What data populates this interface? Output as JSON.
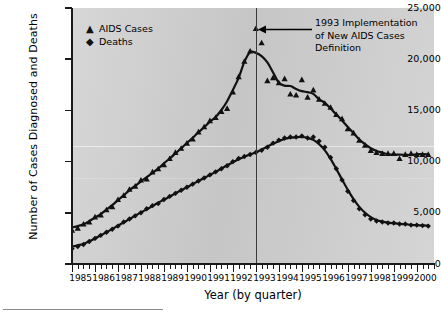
{
  "chart_data": {
    "type": "line",
    "title": "",
    "xlabel": "Year (by quarter)",
    "ylabel": "Number of Cases Diagnosed and Deaths",
    "xlim": [
      1985,
      2000.75
    ],
    "ylim": [
      0,
      25000
    ],
    "ytick_values": [
      0,
      5000,
      10000,
      15000,
      20000,
      25000
    ],
    "ytick_labels": [
      "0",
      "5,000",
      "10,000",
      "15,000",
      "20,000",
      "25,000"
    ],
    "xtick_labels": [
      "1985",
      "1986",
      "1987",
      "1988",
      "1989",
      "1990",
      "1991",
      "1992",
      "1993",
      "1994",
      "1995",
      "1996",
      "1997",
      "1998",
      "1999",
      "2000"
    ],
    "grid": false,
    "legend_position": "top-left",
    "annotations": [
      {
        "text_line1": "1993 Implementation",
        "text_line2": "of New AIDS Cases",
        "text_line3": "Definition",
        "points_to_year": 1993.0,
        "arrow_direction": "left"
      }
    ],
    "reference_lines": [
      {
        "year": 1993.0,
        "orientation": "vertical"
      }
    ],
    "x": [
      1985.0,
      1985.25,
      1985.5,
      1985.75,
      1986.0,
      1986.25,
      1986.5,
      1986.75,
      1987.0,
      1987.25,
      1987.5,
      1987.75,
      1988.0,
      1988.25,
      1988.5,
      1988.75,
      1989.0,
      1989.25,
      1989.5,
      1989.75,
      1990.0,
      1990.25,
      1990.5,
      1990.75,
      1991.0,
      1991.25,
      1991.5,
      1991.75,
      1992.0,
      1992.25,
      1992.5,
      1992.75,
      1993.0,
      1993.25,
      1993.5,
      1993.75,
      1994.0,
      1994.25,
      1994.5,
      1994.75,
      1995.0,
      1995.25,
      1995.5,
      1995.75,
      1996.0,
      1996.25,
      1996.5,
      1996.75,
      1997.0,
      1997.25,
      1997.5,
      1997.75,
      1998.0,
      1998.25,
      1998.5,
      1998.75,
      1999.0,
      1999.25,
      1999.5,
      1999.75,
      2000.0,
      2000.25,
      2000.5
    ],
    "series": [
      {
        "name": "AIDS Cases",
        "marker": "triangle",
        "color": "#111111",
        "values": [
          3300,
          3500,
          3900,
          4100,
          4600,
          4800,
          5300,
          5600,
          6300,
          6700,
          7300,
          7600,
          8200,
          8300,
          9000,
          9300,
          9700,
          10300,
          10900,
          11300,
          11800,
          12200,
          12900,
          13400,
          14000,
          14300,
          14900,
          15200,
          16800,
          18300,
          19800,
          20800,
          23000,
          21600,
          17900,
          18200,
          17700,
          18100,
          16600,
          16500,
          18000,
          16300,
          17000,
          16100,
          15700,
          15300,
          14600,
          14200,
          13200,
          12800,
          12100,
          11600,
          11100,
          10900,
          10800,
          10800,
          10800,
          10300,
          10700,
          10800,
          10700,
          10700,
          10700
        ]
      },
      {
        "name": "Deaths",
        "marker": "diamond",
        "color": "#111111",
        "values": [
          1500,
          1700,
          1900,
          2200,
          2500,
          2800,
          3100,
          3400,
          3700,
          4100,
          4400,
          4700,
          5000,
          5400,
          5700,
          5900,
          6300,
          6600,
          6900,
          7200,
          7500,
          7800,
          8100,
          8400,
          8700,
          9000,
          9300,
          9600,
          10000,
          10300,
          10500,
          10700,
          10900,
          11100,
          11400,
          11800,
          12100,
          12300,
          12400,
          12400,
          12500,
          12300,
          12400,
          12000,
          11400,
          10400,
          9300,
          8200,
          7100,
          6200,
          5400,
          4800,
          4400,
          4200,
          4100,
          4000,
          4000,
          3900,
          3900,
          3800,
          3800,
          3750,
          3700
        ]
      }
    ]
  },
  "legend": {
    "items": [
      {
        "symbol": "▲",
        "label": "AIDS Cases"
      },
      {
        "symbol": "◆",
        "label": "Deaths"
      }
    ]
  }
}
